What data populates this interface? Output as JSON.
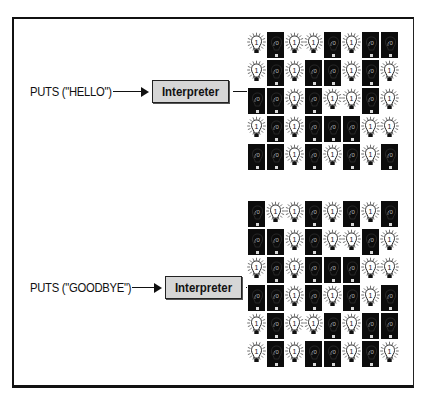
{
  "diagram": {
    "top": {
      "code_label": "PUTS (\"HELLO\")",
      "interpreter_label": "Interpreter",
      "bulbs": [
        [
          1,
          0,
          1,
          1,
          0,
          1,
          0,
          0
        ],
        [
          1,
          0,
          1,
          0,
          0,
          1,
          0,
          1
        ],
        [
          0,
          0,
          1,
          0,
          1,
          1,
          0,
          1
        ],
        [
          1,
          0,
          1,
          0,
          0,
          0,
          1,
          1
        ],
        [
          0,
          0,
          1,
          0,
          1,
          0,
          1,
          0
        ]
      ]
    },
    "bottom": {
      "code_label": "PUTS (\"GOODBYE\")",
      "interpreter_label": "Interpreter",
      "bulbs": [
        [
          0,
          1,
          1,
          0,
          1,
          0,
          1,
          0
        ],
        [
          0,
          0,
          1,
          0,
          1,
          1,
          0,
          1
        ],
        [
          1,
          0,
          1,
          0,
          0,
          0,
          1,
          1
        ],
        [
          0,
          0,
          1,
          0,
          1,
          0,
          1,
          0
        ],
        [
          1,
          0,
          1,
          1,
          0,
          1,
          0,
          0
        ],
        [
          1,
          0,
          1,
          0,
          0,
          1,
          0,
          1
        ]
      ]
    },
    "bulb_on_text": "1",
    "bulb_off_text": "0",
    "colors": {
      "frame": "#111111",
      "interpreter_fill": "#d6d6d6",
      "bulb_off_bg": "#0c0c0c",
      "bulb_on_bg": "#ffffff"
    }
  }
}
